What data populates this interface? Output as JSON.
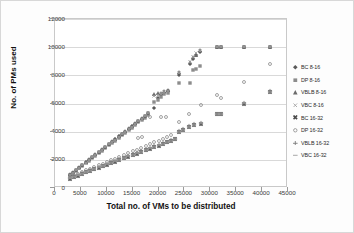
{
  "chart_data": {
    "type": "scatter",
    "title": "",
    "xlabel": "Total no. of VMs to be distributed",
    "ylabel": "No. of PMs used",
    "xlim": [
      0,
      45000
    ],
    "ylim": [
      0,
      12000
    ],
    "xticks": [
      0,
      5000,
      10000,
      15000,
      20000,
      25000,
      30000,
      35000,
      40000,
      45000
    ],
    "yticks": [
      0,
      2000,
      4000,
      6000,
      8000,
      10000,
      12000
    ],
    "grid": "horizontal",
    "legend_position": "right",
    "series": [
      {
        "name": "BC 8-16",
        "marker": "diamond",
        "color": "#5a5a5a",
        "points": [
          [
            3000,
            880
          ],
          [
            3600,
            1020
          ],
          [
            4200,
            1200
          ],
          [
            4900,
            1380
          ],
          [
            5500,
            1560
          ],
          [
            6100,
            1740
          ],
          [
            6800,
            1940
          ],
          [
            7400,
            2120
          ],
          [
            8000,
            2290
          ],
          [
            8700,
            2490
          ],
          [
            9300,
            2660
          ],
          [
            9900,
            2840
          ],
          [
            10600,
            3040
          ],
          [
            11200,
            3220
          ],
          [
            11800,
            3390
          ],
          [
            12500,
            3590
          ],
          [
            13100,
            3760
          ],
          [
            13700,
            3940
          ],
          [
            14400,
            4140
          ],
          [
            15000,
            4310
          ],
          [
            15600,
            4490
          ],
          [
            16300,
            4690
          ],
          [
            16900,
            4860
          ],
          [
            17500,
            5040
          ],
          [
            18200,
            5240
          ],
          [
            19400,
            5600
          ],
          [
            20000,
            6350
          ],
          [
            20600,
            6500
          ],
          [
            21300,
            6700
          ],
          [
            22000,
            6800
          ],
          [
            24200,
            7950
          ],
          [
            26200,
            8700
          ],
          [
            26800,
            9100
          ],
          [
            27400,
            9350
          ],
          [
            28200,
            9600
          ],
          [
            31500,
            9950
          ],
          [
            32200,
            9960
          ],
          [
            36700,
            9960
          ],
          [
            41800,
            9960
          ]
        ]
      },
      {
        "name": "DP 8-16",
        "marker": "square",
        "color": "#8c8c8c",
        "points": [
          [
            3000,
            840
          ],
          [
            3600,
            980
          ],
          [
            4200,
            1150
          ],
          [
            4900,
            1330
          ],
          [
            5500,
            1500
          ],
          [
            6100,
            1680
          ],
          [
            6800,
            1880
          ],
          [
            7400,
            2050
          ],
          [
            8000,
            2220
          ],
          [
            8700,
            2420
          ],
          [
            9300,
            2590
          ],
          [
            9900,
            2760
          ],
          [
            10600,
            2960
          ],
          [
            11200,
            3130
          ],
          [
            11800,
            3300
          ],
          [
            12500,
            3500
          ],
          [
            13100,
            3670
          ],
          [
            13700,
            3840
          ],
          [
            14400,
            4040
          ],
          [
            15000,
            4210
          ],
          [
            15600,
            4380
          ],
          [
            16300,
            4580
          ],
          [
            16900,
            4750
          ],
          [
            17500,
            4920
          ],
          [
            18200,
            5120
          ],
          [
            19400,
            6050
          ],
          [
            20000,
            6200
          ],
          [
            20600,
            6400
          ],
          [
            21300,
            6600
          ],
          [
            22000,
            6700
          ],
          [
            24200,
            7400
          ],
          [
            26200,
            7400
          ],
          [
            26800,
            8300
          ],
          [
            27400,
            8400
          ],
          [
            28200,
            8600
          ],
          [
            31500,
            9950
          ],
          [
            32200,
            9960
          ],
          [
            36700,
            9960
          ],
          [
            41800,
            9960
          ]
        ]
      },
      {
        "name": "VBLB 8-16",
        "marker": "triangle",
        "color": "#6b6b6b",
        "points": [
          [
            3000,
            900
          ],
          [
            3600,
            1050
          ],
          [
            4200,
            1230
          ],
          [
            4900,
            1410
          ],
          [
            5500,
            1590
          ],
          [
            6100,
            1770
          ],
          [
            6800,
            1970
          ],
          [
            7400,
            2150
          ],
          [
            8000,
            2320
          ],
          [
            8700,
            2520
          ],
          [
            9300,
            2690
          ],
          [
            9900,
            2870
          ],
          [
            10600,
            3070
          ],
          [
            11200,
            3250
          ],
          [
            11800,
            3420
          ],
          [
            12500,
            3620
          ],
          [
            13100,
            3790
          ],
          [
            13700,
            3970
          ],
          [
            14400,
            4170
          ],
          [
            15000,
            4340
          ],
          [
            15600,
            4520
          ],
          [
            16300,
            4720
          ],
          [
            16900,
            4890
          ],
          [
            17500,
            5070
          ],
          [
            18200,
            5270
          ],
          [
            19400,
            6600
          ],
          [
            20000,
            6650
          ],
          [
            20600,
            6700
          ],
          [
            21300,
            6850
          ],
          [
            22000,
            6900
          ],
          [
            24200,
            8150
          ],
          [
            26200,
            8900
          ],
          [
            26800,
            9250
          ],
          [
            27400,
            9400
          ],
          [
            28200,
            9700
          ],
          [
            31500,
            9950
          ],
          [
            32200,
            9960
          ],
          [
            36700,
            9960
          ],
          [
            41800,
            9960
          ]
        ]
      },
      {
        "name": "VBC 8-16",
        "marker": "x-thin",
        "color": "#9a9a9a",
        "points": [
          [
            3000,
            860
          ],
          [
            3600,
            1000
          ],
          [
            4200,
            1180
          ],
          [
            4900,
            1360
          ],
          [
            5500,
            1540
          ],
          [
            6100,
            1720
          ],
          [
            6800,
            1920
          ],
          [
            7400,
            2100
          ],
          [
            8000,
            2270
          ],
          [
            8700,
            2470
          ],
          [
            9300,
            2640
          ],
          [
            9900,
            2820
          ],
          [
            10600,
            3020
          ],
          [
            11200,
            3200
          ],
          [
            11800,
            3370
          ],
          [
            12500,
            3570
          ],
          [
            13100,
            3740
          ],
          [
            13700,
            3920
          ],
          [
            14400,
            4120
          ],
          [
            15000,
            4290
          ],
          [
            15600,
            4470
          ],
          [
            16300,
            4670
          ],
          [
            16900,
            4840
          ],
          [
            17500,
            5020
          ],
          [
            18200,
            5220
          ],
          [
            19400,
            6450
          ],
          [
            20000,
            6550
          ],
          [
            20600,
            6600
          ],
          [
            21300,
            6750
          ],
          [
            22000,
            6850
          ],
          [
            24200,
            8100
          ],
          [
            26200,
            8850
          ],
          [
            26800,
            9200
          ],
          [
            27400,
            9500
          ],
          [
            28200,
            9650
          ],
          [
            31500,
            9950
          ],
          [
            32200,
            9960
          ],
          [
            36700,
            9960
          ],
          [
            41800,
            9960
          ]
        ]
      },
      {
        "name": "BC 16-32",
        "marker": "x-bold",
        "color": "#4a4a4a",
        "points": [
          [
            3000,
            600
          ],
          [
            3800,
            700
          ],
          [
            4600,
            810
          ],
          [
            5400,
            920
          ],
          [
            6200,
            1030
          ],
          [
            7000,
            1140
          ],
          [
            7800,
            1250
          ],
          [
            8600,
            1360
          ],
          [
            9400,
            1470
          ],
          [
            10200,
            1580
          ],
          [
            11000,
            1690
          ],
          [
            11800,
            1800
          ],
          [
            12600,
            1910
          ],
          [
            13500,
            2030
          ],
          [
            14300,
            2140
          ],
          [
            15200,
            2260
          ],
          [
            16000,
            2370
          ],
          [
            16800,
            2480
          ],
          [
            17700,
            2600
          ],
          [
            18500,
            2710
          ],
          [
            19400,
            2830
          ],
          [
            20200,
            2940
          ],
          [
            21000,
            3050
          ],
          [
            21800,
            3160
          ],
          [
            22600,
            3270
          ],
          [
            23400,
            3380
          ],
          [
            24200,
            3900
          ],
          [
            25000,
            4050
          ],
          [
            26000,
            4250
          ],
          [
            27000,
            4400
          ],
          [
            28400,
            4500
          ],
          [
            31500,
            5150
          ],
          [
            32200,
            5150
          ],
          [
            36700,
            5900
          ],
          [
            41800,
            6750
          ]
        ]
      },
      {
        "name": "DP 16-32",
        "marker": "circle",
        "color": "#8a8a8a",
        "points": [
          [
            3000,
            700
          ],
          [
            3800,
            820
          ],
          [
            4600,
            940
          ],
          [
            5400,
            1060
          ],
          [
            6200,
            1180
          ],
          [
            7000,
            1300
          ],
          [
            7800,
            1420
          ],
          [
            8600,
            1540
          ],
          [
            9400,
            1660
          ],
          [
            10200,
            1780
          ],
          [
            11000,
            1900
          ],
          [
            11800,
            2020
          ],
          [
            12600,
            2150
          ],
          [
            13500,
            2280
          ],
          [
            14300,
            2400
          ],
          [
            15200,
            2530
          ],
          [
            16000,
            2650
          ],
          [
            16800,
            2780
          ],
          [
            17700,
            2900
          ],
          [
            18500,
            3030
          ],
          [
            19400,
            3160
          ],
          [
            20200,
            3280
          ],
          [
            21000,
            3410
          ],
          [
            21800,
            3530
          ],
          [
            22600,
            3660
          ],
          [
            16300,
            3500
          ],
          [
            16900,
            3550
          ],
          [
            18600,
            4950
          ],
          [
            20600,
            4950
          ],
          [
            21700,
            4950
          ],
          [
            24200,
            4650
          ],
          [
            26000,
            5200
          ],
          [
            28400,
            5850
          ],
          [
            31500,
            6550
          ],
          [
            32200,
            6300
          ],
          [
            36700,
            7450
          ],
          [
            41800,
            8750
          ]
        ]
      },
      {
        "name": "VBLB 16-32",
        "marker": "plus",
        "color": "#7a7a7a",
        "points": [
          [
            3000,
            640
          ],
          [
            3800,
            750
          ],
          [
            4600,
            860
          ],
          [
            5400,
            970
          ],
          [
            6200,
            1080
          ],
          [
            7000,
            1190
          ],
          [
            7800,
            1300
          ],
          [
            8600,
            1410
          ],
          [
            9400,
            1520
          ],
          [
            10200,
            1630
          ],
          [
            11000,
            1740
          ],
          [
            11800,
            1850
          ],
          [
            12600,
            1960
          ],
          [
            13500,
            2080
          ],
          [
            14300,
            2190
          ],
          [
            15200,
            2310
          ],
          [
            16000,
            2420
          ],
          [
            16800,
            2530
          ],
          [
            17700,
            2650
          ],
          [
            18500,
            2760
          ],
          [
            19400,
            2880
          ],
          [
            20200,
            2990
          ],
          [
            21000,
            3100
          ],
          [
            21800,
            3210
          ],
          [
            22600,
            3320
          ],
          [
            23400,
            3430
          ],
          [
            24200,
            3950
          ],
          [
            25000,
            4100
          ],
          [
            26000,
            4300
          ],
          [
            27000,
            4450
          ],
          [
            28400,
            4550
          ],
          [
            31500,
            5200
          ],
          [
            32200,
            5200
          ],
          [
            36700,
            5950
          ],
          [
            41800,
            6800
          ]
        ]
      },
      {
        "name": "VBC 16-32",
        "marker": "dash",
        "color": "#a8a8a8",
        "points": [
          [
            3000,
            620
          ],
          [
            3800,
            730
          ],
          [
            4600,
            840
          ],
          [
            5400,
            950
          ],
          [
            6200,
            1060
          ],
          [
            7000,
            1170
          ],
          [
            7800,
            1280
          ],
          [
            8600,
            1390
          ],
          [
            9400,
            1500
          ],
          [
            10200,
            1610
          ],
          [
            11000,
            1720
          ],
          [
            11800,
            1830
          ],
          [
            12600,
            1940
          ],
          [
            13500,
            2060
          ],
          [
            14300,
            2170
          ],
          [
            15200,
            2290
          ],
          [
            16000,
            2400
          ],
          [
            16800,
            2510
          ],
          [
            17700,
            2630
          ],
          [
            18500,
            2740
          ],
          [
            19400,
            2860
          ],
          [
            20200,
            2970
          ],
          [
            21000,
            3080
          ],
          [
            21800,
            3190
          ],
          [
            22600,
            3300
          ],
          [
            23400,
            3410
          ],
          [
            24200,
            3930
          ],
          [
            25000,
            4080
          ],
          [
            26000,
            4280
          ],
          [
            27000,
            4430
          ],
          [
            28400,
            4530
          ],
          [
            31500,
            5180
          ],
          [
            32200,
            5180
          ],
          [
            36700,
            5930
          ],
          [
            41800,
            6780
          ]
        ]
      }
    ]
  }
}
